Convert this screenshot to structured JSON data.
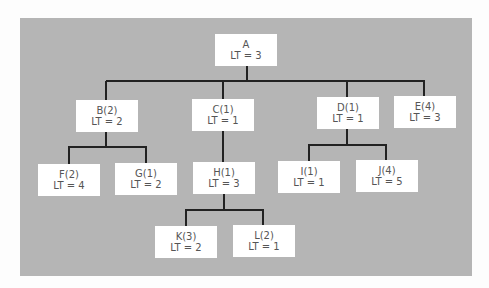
{
  "diagram": {
    "type": "tree",
    "colors": {
      "background": "#b5b5b5",
      "node_fill": "#ffffff",
      "edge": "#222222",
      "text": "#555555"
    },
    "nodes": {
      "A": {
        "name": "A",
        "lt": "LT = 3"
      },
      "B": {
        "name": "B(2)",
        "lt": "LT = 2"
      },
      "C": {
        "name": "C(1)",
        "lt": "LT = 1"
      },
      "D": {
        "name": "D(1)",
        "lt": "LT = 1"
      },
      "E": {
        "name": "E(4)",
        "lt": "LT = 3"
      },
      "F": {
        "name": "F(2)",
        "lt": "LT = 4"
      },
      "G": {
        "name": "G(1)",
        "lt": "LT = 2"
      },
      "H": {
        "name": "H(1)",
        "lt": "LT = 3"
      },
      "I": {
        "name": "I(1)",
        "lt": "LT = 1"
      },
      "J": {
        "name": "J(4)",
        "lt": "LT = 5"
      },
      "K": {
        "name": "K(3)",
        "lt": "LT = 2"
      },
      "L": {
        "name": "L(2)",
        "lt": "LT = 1"
      }
    },
    "edges": [
      [
        "A",
        "B"
      ],
      [
        "A",
        "C"
      ],
      [
        "A",
        "D"
      ],
      [
        "A",
        "E"
      ],
      [
        "B",
        "F"
      ],
      [
        "B",
        "G"
      ],
      [
        "C",
        "H"
      ],
      [
        "D",
        "I"
      ],
      [
        "D",
        "J"
      ],
      [
        "H",
        "K"
      ],
      [
        "H",
        "L"
      ]
    ]
  }
}
